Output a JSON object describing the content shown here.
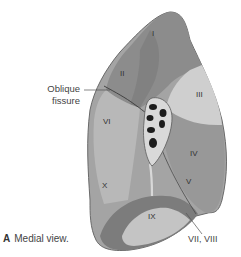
{
  "figure": {
    "caption_letter": "A",
    "caption_text": "Medial view.",
    "callouts": {
      "oblique_fissure_line1": "Oblique",
      "oblique_fissure_line2": "fissure",
      "segments_vii_viii": "VII, VIII"
    },
    "segments": {
      "I": "I",
      "II": "II",
      "III": "III",
      "IV": "IV",
      "V": "V",
      "VI": "VI",
      "IX": "IX",
      "X": "X"
    },
    "colors": {
      "upper_lobe_dark": "#8a8a8a",
      "upper_lobe_light": "#cfcfcf",
      "lower_lobe": "#a4a4a4",
      "middle_lobe": "#9a9a9a",
      "diaphragmatic": "#bdbdbd",
      "hilum_vessels": "#1c1c1c",
      "outline": "#6a6a6a"
    }
  }
}
